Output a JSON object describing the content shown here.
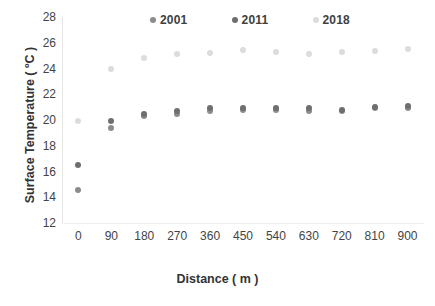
{
  "chart_data": {
    "type": "scatter",
    "title": "",
    "xlabel": "Distance ( m )",
    "ylabel": "Surface Temperature ( ºC )",
    "xlim": [
      -45,
      945
    ],
    "ylim": [
      12,
      28
    ],
    "xticks": [
      0,
      90,
      180,
      270,
      360,
      450,
      540,
      630,
      720,
      810,
      900
    ],
    "yticks": [
      12,
      14,
      16,
      18,
      20,
      22,
      24,
      26,
      28
    ],
    "grid": false,
    "legend_position": "top-center",
    "x": [
      0,
      90,
      180,
      270,
      360,
      450,
      540,
      630,
      720,
      810,
      900
    ],
    "series": [
      {
        "name": "2001",
        "color": "#8c8c8c",
        "values": [
          14.6,
          19.4,
          20.3,
          20.5,
          20.7,
          20.8,
          20.8,
          20.7,
          20.7,
          20.9,
          20.9
        ]
      },
      {
        "name": "2011",
        "color": "#6e6e6e",
        "values": [
          16.5,
          19.9,
          20.5,
          20.7,
          20.9,
          20.9,
          20.9,
          20.9,
          20.8,
          21.0,
          21.1
        ]
      },
      {
        "name": "2018",
        "color": "#dcdcdc",
        "values": [
          19.95,
          24.0,
          24.8,
          25.1,
          25.2,
          25.4,
          25.3,
          25.1,
          25.25,
          25.35,
          25.55
        ]
      }
    ]
  }
}
